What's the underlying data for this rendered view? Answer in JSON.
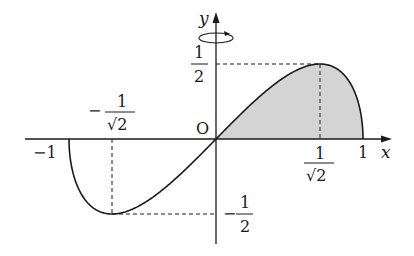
{
  "diagram": {
    "type": "function-graph",
    "function": "y = x*sqrt(1 - x^2)",
    "domain": [
      -1,
      1
    ],
    "shaded_region": "area between curve and x-axis for 0 <= x <= 1",
    "rotation_indicator": "rotation about y-axis",
    "axes": {
      "x_label": "x",
      "y_label": "y",
      "origin_label": "O"
    },
    "labels": {
      "x_neg_one": "−1",
      "x_pos_one": "1",
      "x_neg_inv_sqrt2_sign": "−",
      "x_neg_inv_sqrt2_num": "1",
      "x_neg_inv_sqrt2_den": "√2",
      "x_pos_inv_sqrt2_num": "1",
      "x_pos_inv_sqrt2_den": "√2",
      "y_half_num": "1",
      "y_half_den": "2",
      "y_neg_half_sign": "−",
      "y_neg_half_num": "1",
      "y_neg_half_den": "2"
    },
    "key_points": [
      {
        "name": "maximum",
        "x": "1/√2",
        "y": "1/2"
      },
      {
        "name": "minimum",
        "x": "-1/√2",
        "y": "-1/2"
      },
      {
        "name": "origin",
        "x": "0",
        "y": "0"
      },
      {
        "name": "right-zero",
        "x": "1",
        "y": "0"
      },
      {
        "name": "left-zero",
        "x": "-1",
        "y": "0"
      }
    ],
    "colors": {
      "line": "#1a1a1a",
      "shade": "#d4d4d4",
      "background": "#ffffff"
    }
  }
}
